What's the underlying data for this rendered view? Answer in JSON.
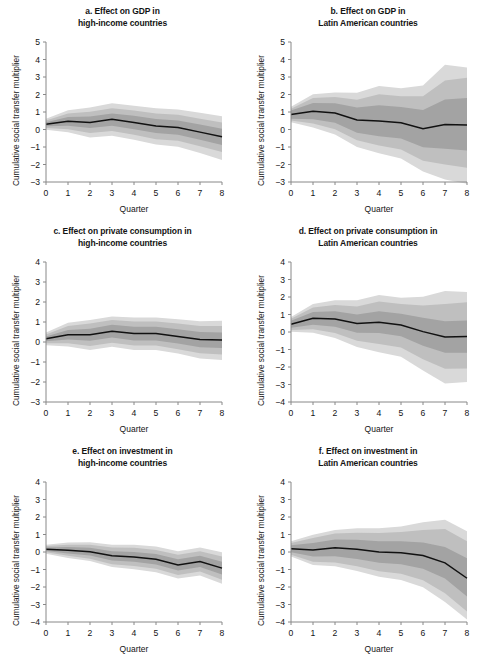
{
  "figure": {
    "axis_labels": {
      "x": "Quarter",
      "y": "Cumulative social transfer multiplier"
    },
    "colors": {
      "band_outer": "#d9d9d9",
      "band_mid": "#bfbfbf",
      "band_inner": "#a3a3a3",
      "line": "#111111",
      "axis": "#888888",
      "text": "#141414",
      "background": "#ffffff"
    }
  },
  "chart_data": [
    {
      "type": "area",
      "panel": "a",
      "title": "a. Effect on GDP in high-income countries",
      "title_line1": "a. Effect on GDP in",
      "title_line2": "high-income countries",
      "xlabel": "Quarter",
      "ylabel": "Cumulative social transfer multiplier",
      "x": [
        0,
        1,
        2,
        3,
        4,
        5,
        6,
        7,
        8
      ],
      "xlim": [
        0,
        8
      ],
      "ylim": [
        -3,
        5
      ],
      "yticks": [
        -3,
        -2,
        -1,
        0,
        1,
        2,
        3,
        4,
        5
      ],
      "xticks": [
        0,
        1,
        2,
        3,
        4,
        5,
        6,
        7,
        8
      ],
      "grid": false,
      "legend": "none",
      "series": [
        {
          "name": "median",
          "values": [
            0.3,
            0.47,
            0.4,
            0.58,
            0.4,
            0.2,
            0.12,
            -0.15,
            -0.42
          ]
        },
        {
          "name": "inner_band_upper",
          "values": [
            0.42,
            0.72,
            0.74,
            0.92,
            0.78,
            0.6,
            0.52,
            0.28,
            0.05
          ]
        },
        {
          "name": "inner_band_lower",
          "values": [
            0.18,
            0.22,
            0.08,
            0.22,
            0.02,
            -0.2,
            -0.3,
            -0.58,
            -0.88
          ]
        },
        {
          "name": "mid_band_upper",
          "values": [
            0.52,
            0.92,
            1.02,
            1.22,
            1.08,
            0.92,
            0.84,
            0.62,
            0.4
          ]
        },
        {
          "name": "mid_band_lower",
          "values": [
            0.08,
            0.02,
            -0.2,
            -0.08,
            -0.3,
            -0.55,
            -0.64,
            -0.95,
            -1.28
          ]
        },
        {
          "name": "outer_band_upper",
          "values": [
            0.62,
            1.1,
            1.26,
            1.5,
            1.36,
            1.22,
            1.14,
            0.96,
            0.76
          ]
        },
        {
          "name": "outer_band_lower",
          "values": [
            -0.02,
            -0.16,
            -0.45,
            -0.35,
            -0.58,
            -0.86,
            -0.98,
            -1.34,
            -1.74
          ]
        }
      ]
    },
    {
      "type": "area",
      "panel": "b",
      "title": "b. Effect on GDP in Latin American countries",
      "title_line1": "b. Effect on GDP in",
      "title_line2": "Latin American countries",
      "xlabel": "Quarter",
      "ylabel": "Cumulative social transfer multiplier",
      "x": [
        0,
        1,
        2,
        3,
        4,
        5,
        6,
        7,
        8
      ],
      "xlim": [
        0,
        8
      ],
      "ylim": [
        -3,
        5
      ],
      "yticks": [
        -3,
        -2,
        -1,
        0,
        1,
        2,
        3,
        4,
        5
      ],
      "xticks": [
        0,
        1,
        2,
        3,
        4,
        5,
        6,
        7,
        8
      ],
      "grid": false,
      "legend": "none",
      "series": [
        {
          "name": "median",
          "values": [
            0.86,
            1.04,
            0.94,
            0.54,
            0.48,
            0.38,
            0.05,
            0.28,
            0.26
          ]
        },
        {
          "name": "inner_band_upper",
          "values": [
            1.08,
            1.52,
            1.5,
            1.26,
            1.38,
            1.28,
            1.12,
            1.72,
            1.8
          ]
        },
        {
          "name": "inner_band_lower",
          "values": [
            0.62,
            0.58,
            0.38,
            -0.18,
            -0.38,
            -0.52,
            -1.02,
            -1.1,
            -1.2
          ]
        },
        {
          "name": "mid_band_upper",
          "values": [
            1.18,
            1.8,
            1.86,
            1.7,
            2.02,
            1.9,
            1.9,
            2.8,
            2.96
          ]
        },
        {
          "name": "mid_band_lower",
          "values": [
            0.52,
            0.34,
            0.02,
            -0.62,
            -0.92,
            -1.14,
            -1.78,
            -2.0,
            -2.18
          ]
        },
        {
          "name": "outer_band_upper",
          "values": [
            1.3,
            2.02,
            2.12,
            2.1,
            2.48,
            2.36,
            2.52,
            3.7,
            3.54
          ]
        },
        {
          "name": "outer_band_lower",
          "values": [
            0.42,
            0.12,
            -0.28,
            -1.0,
            -1.36,
            -1.66,
            -2.4,
            -2.86,
            -3.1
          ]
        }
      ]
    },
    {
      "type": "area",
      "panel": "c",
      "title": "c. Effect on private consumption in high-income countries",
      "title_line1": "c. Effect on private consumption in",
      "title_line2": "high-income countries",
      "xlabel": "Quarter",
      "ylabel": "Cumulative social transfer multiplier",
      "x": [
        0,
        1,
        2,
        3,
        4,
        5,
        6,
        7,
        8
      ],
      "xlim": [
        0,
        8
      ],
      "ylim": [
        -3,
        4
      ],
      "yticks": [
        -3,
        -2,
        -1,
        0,
        1,
        2,
        3,
        4
      ],
      "xticks": [
        0,
        1,
        2,
        3,
        4,
        5,
        6,
        7,
        8
      ],
      "grid": false,
      "legend": "none",
      "series": [
        {
          "name": "median",
          "values": [
            0.16,
            0.36,
            0.36,
            0.54,
            0.42,
            0.42,
            0.28,
            0.12,
            0.1
          ]
        },
        {
          "name": "inner_band_upper",
          "values": [
            0.28,
            0.6,
            0.66,
            0.86,
            0.76,
            0.76,
            0.64,
            0.5,
            0.48
          ]
        },
        {
          "name": "inner_band_lower",
          "values": [
            0.04,
            0.12,
            0.06,
            0.22,
            0.08,
            0.08,
            -0.08,
            -0.26,
            -0.3
          ]
        },
        {
          "name": "mid_band_upper",
          "values": [
            0.38,
            0.8,
            0.92,
            1.1,
            1.02,
            1.02,
            0.92,
            0.8,
            0.8
          ]
        },
        {
          "name": "mid_band_lower",
          "values": [
            -0.06,
            -0.06,
            -0.2,
            -0.04,
            -0.18,
            -0.18,
            -0.36,
            -0.56,
            -0.62
          ]
        },
        {
          "name": "outer_band_upper",
          "values": [
            0.48,
            0.96,
            1.1,
            1.28,
            1.22,
            1.22,
            1.14,
            1.04,
            1.06
          ]
        },
        {
          "name": "outer_band_lower",
          "values": [
            -0.16,
            -0.22,
            -0.4,
            -0.24,
            -0.4,
            -0.4,
            -0.58,
            -0.82,
            -0.9
          ]
        }
      ]
    },
    {
      "type": "area",
      "panel": "d",
      "title": "d. Effect on private consumption in Latin American countries",
      "title_line1": "d. Effect on private consumption in",
      "title_line2": "Latin American countries",
      "xlabel": "Quarter",
      "ylabel": "Cumulative social transfer multiplier",
      "x": [
        0,
        1,
        2,
        3,
        4,
        5,
        6,
        7,
        8
      ],
      "xlim": [
        0,
        8
      ],
      "ylim": [
        -4,
        4
      ],
      "yticks": [
        -4,
        -3,
        -2,
        -1,
        0,
        1,
        2,
        3,
        4
      ],
      "xticks": [
        0,
        1,
        2,
        3,
        4,
        5,
        6,
        7,
        8
      ],
      "grid": false,
      "legend": "none",
      "series": [
        {
          "name": "median",
          "values": [
            0.44,
            0.78,
            0.74,
            0.48,
            0.56,
            0.4,
            0.02,
            -0.28,
            -0.26
          ]
        },
        {
          "name": "inner_band_upper",
          "values": [
            0.64,
            1.14,
            1.18,
            1.0,
            1.18,
            1.04,
            0.82,
            0.62,
            0.66
          ]
        },
        {
          "name": "inner_band_lower",
          "values": [
            0.24,
            0.42,
            0.3,
            -0.04,
            -0.06,
            -0.24,
            -0.78,
            -1.18,
            -1.18
          ]
        },
        {
          "name": "mid_band_upper",
          "values": [
            0.76,
            1.4,
            1.54,
            1.46,
            1.74,
            1.6,
            1.52,
            1.6,
            1.7
          ]
        },
        {
          "name": "mid_band_lower",
          "values": [
            0.12,
            0.16,
            -0.06,
            -0.5,
            -0.68,
            -0.88,
            -1.56,
            -2.1,
            -2.08
          ]
        },
        {
          "name": "outer_band_upper",
          "values": [
            0.86,
            1.6,
            1.82,
            1.82,
            2.12,
            1.96,
            2.02,
            2.34,
            2.28
          ]
        },
        {
          "name": "outer_band_lower",
          "values": [
            0.02,
            -0.04,
            -0.34,
            -0.86,
            -1.16,
            -1.42,
            -2.2,
            -2.94,
            -2.86
          ]
        }
      ]
    },
    {
      "type": "area",
      "panel": "e",
      "title": "e. Effect on investment in high-income countries",
      "title_line1": "e. Effect on investment in",
      "title_line2": "high-income countries",
      "xlabel": "Quarter",
      "ylabel": "Cumulative social transfer multiplier",
      "x": [
        0,
        1,
        2,
        3,
        4,
        5,
        6,
        7,
        8
      ],
      "xlim": [
        0,
        8
      ],
      "ylim": [
        -4,
        4
      ],
      "yticks": [
        -4,
        -3,
        -2,
        -1,
        0,
        1,
        2,
        3,
        4
      ],
      "xticks": [
        0,
        1,
        2,
        3,
        4,
        5,
        6,
        7,
        8
      ],
      "grid": false,
      "legend": "none",
      "series": [
        {
          "name": "median",
          "values": [
            0.16,
            0.1,
            0.02,
            -0.22,
            -0.28,
            -0.42,
            -0.74,
            -0.54,
            -0.92
          ]
        },
        {
          "name": "inner_band_upper",
          "values": [
            0.26,
            0.28,
            0.24,
            0.04,
            0.0,
            -0.12,
            -0.42,
            -0.22,
            -0.56
          ]
        },
        {
          "name": "inner_band_lower",
          "values": [
            0.06,
            -0.08,
            -0.2,
            -0.48,
            -0.56,
            -0.72,
            -1.06,
            -0.86,
            -1.28
          ]
        },
        {
          "name": "mid_band_upper",
          "values": [
            0.34,
            0.42,
            0.42,
            0.26,
            0.24,
            0.12,
            -0.16,
            0.04,
            -0.26
          ]
        },
        {
          "name": "mid_band_lower",
          "values": [
            -0.02,
            -0.22,
            -0.38,
            -0.7,
            -0.8,
            -0.96,
            -1.32,
            -1.12,
            -1.58
          ]
        },
        {
          "name": "outer_band_upper",
          "values": [
            0.42,
            0.54,
            0.56,
            0.42,
            0.42,
            0.32,
            0.04,
            0.26,
            -0.02
          ]
        },
        {
          "name": "outer_band_lower",
          "values": [
            -0.1,
            -0.34,
            -0.52,
            -0.86,
            -0.98,
            -1.16,
            -1.52,
            -1.34,
            -1.82
          ]
        }
      ]
    },
    {
      "type": "area",
      "panel": "f",
      "title": "f. Effect on investment in Latin American countries",
      "title_line1": "f. Effect on investment in",
      "title_line2": "Latin American countries",
      "xlabel": "Quarter",
      "ylabel": "Cumulative social transfer multiplier",
      "x": [
        0,
        1,
        2,
        3,
        4,
        5,
        6,
        7,
        8
      ],
      "xlim": [
        0,
        8
      ],
      "ylim": [
        -4,
        4
      ],
      "yticks": [
        -4,
        -3,
        -2,
        -1,
        0,
        1,
        2,
        3,
        4
      ],
      "xticks": [
        0,
        1,
        2,
        3,
        4,
        5,
        6,
        7,
        8
      ],
      "grid": false,
      "legend": "none",
      "series": [
        {
          "name": "median",
          "values": [
            0.18,
            0.12,
            0.24,
            0.16,
            0.0,
            -0.04,
            -0.2,
            -0.62,
            -1.5
          ]
        },
        {
          "name": "inner_band_upper",
          "values": [
            0.38,
            0.52,
            0.72,
            0.7,
            0.62,
            0.62,
            0.54,
            0.28,
            -0.36
          ]
        },
        {
          "name": "inner_band_lower",
          "values": [
            -0.02,
            -0.26,
            -0.24,
            -0.4,
            -0.62,
            -0.7,
            -0.96,
            -1.52,
            -2.54
          ]
        },
        {
          "name": "mid_band_upper",
          "values": [
            0.52,
            0.8,
            1.06,
            1.1,
            1.08,
            1.14,
            1.26,
            1.32,
            0.62
          ]
        },
        {
          "name": "mid_band_lower",
          "values": [
            -0.16,
            -0.56,
            -0.6,
            -0.82,
            -1.1,
            -1.24,
            -1.62,
            -2.36,
            -3.4
          ]
        },
        {
          "name": "outer_band_upper",
          "values": [
            0.62,
            0.98,
            1.26,
            1.36,
            1.36,
            1.46,
            1.7,
            1.84,
            1.18
          ]
        },
        {
          "name": "outer_band_lower",
          "values": [
            -0.26,
            -0.74,
            -0.82,
            -1.08,
            -1.42,
            -1.6,
            -2.02,
            -2.86,
            -3.86
          ]
        }
      ]
    }
  ]
}
